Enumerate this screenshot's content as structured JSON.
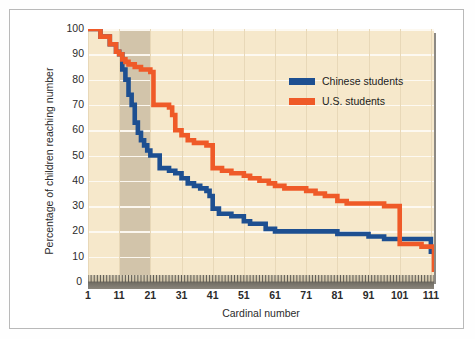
{
  "chart_data": {
    "type": "line",
    "title": "",
    "xlabel": "Cardinal number",
    "ylabel": "Percentage of children reaching number",
    "xlim": [
      1,
      112
    ],
    "ylim": [
      0,
      100
    ],
    "xticks": [
      1,
      11,
      21,
      31,
      41,
      51,
      61,
      71,
      81,
      91,
      101,
      111
    ],
    "yticks": [
      0,
      10,
      20,
      30,
      40,
      50,
      60,
      70,
      80,
      90,
      100
    ],
    "grid": "horizontal-white-and-faint-vertical",
    "legend_position": "upper-right-inside",
    "step_style": "step-post",
    "highlight_band": {
      "label": "teens region",
      "x_start": 11,
      "x_end": 21,
      "color": "#cbbda4"
    },
    "series": [
      {
        "name": "Chinese students",
        "color": "#1d4f91",
        "x": [
          1,
          5,
          8,
          10,
          11,
          12,
          13,
          14,
          15,
          16,
          17,
          18,
          19,
          20,
          21,
          24,
          27,
          29,
          31,
          33,
          35,
          37,
          39,
          40,
          41,
          43,
          45,
          47,
          49,
          51,
          53,
          56,
          58,
          61,
          65,
          71,
          77,
          81,
          86,
          91,
          96,
          101,
          106,
          111,
          112
        ],
        "y": [
          100,
          97,
          94,
          91,
          90,
          84,
          80,
          74,
          70,
          63,
          59,
          56,
          54,
          52,
          50,
          45,
          44,
          43,
          41,
          39,
          38,
          37,
          36,
          34,
          29,
          27,
          27,
          26,
          26,
          24,
          23,
          23,
          21,
          20,
          20,
          20,
          20,
          19,
          19,
          18,
          17,
          17,
          17,
          12,
          11
        ]
      },
      {
        "name": "U.S. students",
        "color": "#ef5a28",
        "x": [
          1,
          5,
          8,
          10,
          11,
          12,
          13,
          14,
          15,
          16,
          17,
          18,
          19,
          20,
          21,
          22,
          24,
          27,
          28,
          29,
          31,
          33,
          35,
          37,
          39,
          41,
          42,
          44,
          47,
          51,
          53,
          56,
          59,
          61,
          64,
          67,
          71,
          74,
          77,
          81,
          84,
          87,
          91,
          96,
          100,
          101,
          104,
          108,
          111,
          112
        ],
        "y": [
          100,
          97,
          94,
          91,
          90,
          88,
          87,
          86,
          86,
          85,
          85,
          84,
          84,
          84,
          83,
          70,
          70,
          69,
          66,
          60,
          58,
          56,
          55,
          55,
          54,
          45,
          45,
          44,
          43,
          42,
          41,
          40,
          39,
          38,
          37,
          37,
          36,
          35,
          34,
          32,
          31,
          31,
          31,
          30,
          30,
          15,
          15,
          14,
          14,
          4
        ]
      }
    ]
  },
  "legend": {
    "items": [
      {
        "label": "Chinese students",
        "color": "#1d4f91"
      },
      {
        "label": "U.S. students",
        "color": "#ef5a28"
      }
    ]
  },
  "axes": {
    "x_title": "Cardinal number",
    "y_title": "Percentage of children reaching number",
    "x_tick_labels": [
      "1",
      "11",
      "21",
      "31",
      "41",
      "51",
      "61",
      "71",
      "81",
      "91",
      "101",
      "111"
    ],
    "y_tick_labels": [
      "100",
      "90",
      "80",
      "70",
      "60",
      "50",
      "40",
      "30",
      "20",
      "10",
      "0"
    ]
  },
  "colors": {
    "plot_background": "#f6e8cb",
    "band": "#cbbda4",
    "gridline": "#fdfaf2",
    "chinese": "#1d4f91",
    "us": "#ef5a28",
    "frame": "#b9b9b9"
  }
}
